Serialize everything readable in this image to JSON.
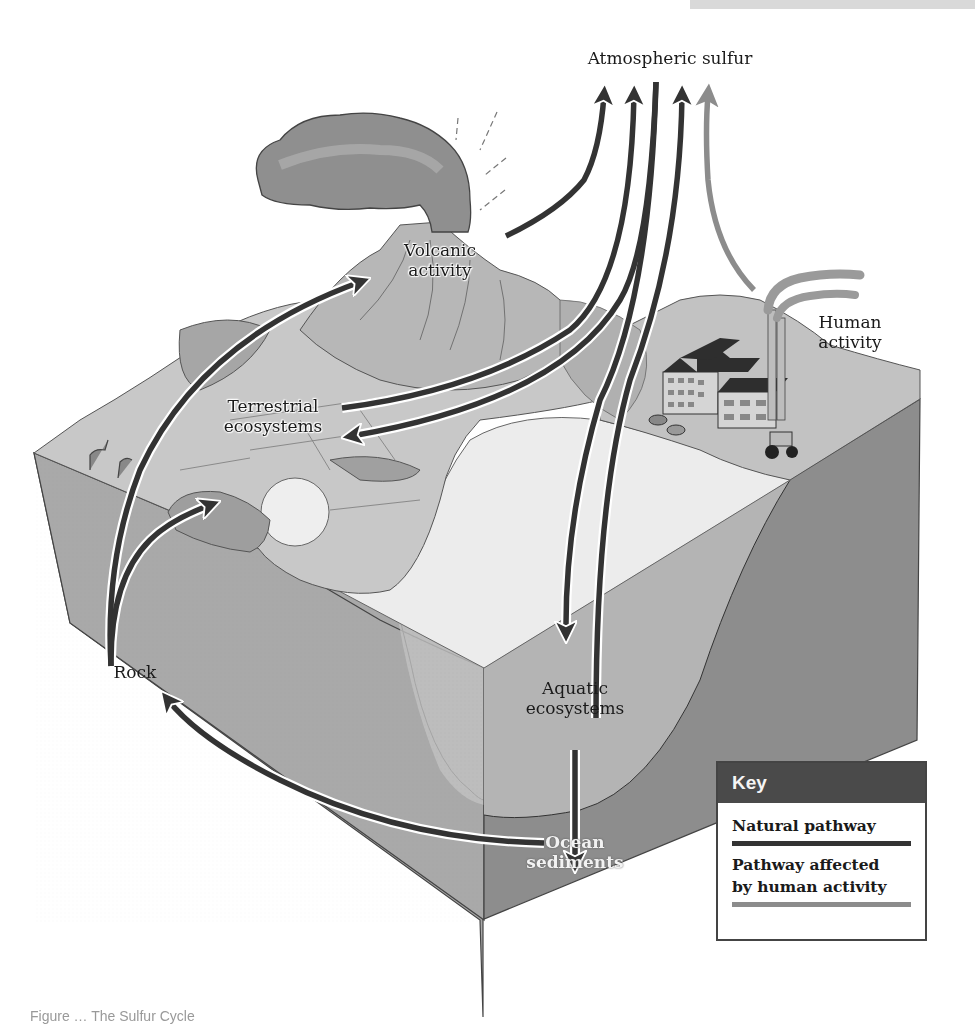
{
  "figure": {
    "title": "The Sulfur Cycle",
    "caption_partial": "Figure … The Sulfur Cycle"
  },
  "nodes": {
    "atmospheric_sulfur": "Atmospheric sulfur",
    "volcanic_activity_line1": "Volcanic",
    "volcanic_activity_line2": "activity",
    "human_activity_line1": "Human",
    "human_activity_line2": "activity",
    "terrestrial_line1": "Terrestrial",
    "terrestrial_line2": "ecosystems",
    "rock": "Rock",
    "aquatic_line1": "Aquatic",
    "aquatic_line2": "ecosystems",
    "ocean_line1": "Ocean",
    "ocean_line2": "sediments"
  },
  "key": {
    "title": "Key",
    "items": [
      {
        "label": "Natural pathway",
        "color": "#333333"
      },
      {
        "label_line1": "Pathway affected",
        "label_line2": "by human activity",
        "color": "#8c8c8c"
      }
    ]
  },
  "pathways": [
    {
      "from": "Volcanic activity",
      "to": "Atmospheric sulfur",
      "type": "natural"
    },
    {
      "from": "Terrestrial ecosystems",
      "to": "Atmospheric sulfur",
      "type": "natural"
    },
    {
      "from": "Atmospheric sulfur",
      "to": "Terrestrial ecosystems",
      "type": "natural"
    },
    {
      "from": "Atmospheric sulfur",
      "to": "Aquatic ecosystems",
      "type": "natural"
    },
    {
      "from": "Aquatic ecosystems",
      "to": "Atmospheric sulfur",
      "type": "natural"
    },
    {
      "from": "Human activity",
      "to": "Atmospheric sulfur",
      "type": "human"
    },
    {
      "from": "Rock",
      "to": "Volcanic activity",
      "type": "natural"
    },
    {
      "from": "Rock",
      "to": "Terrestrial ecosystems",
      "type": "natural"
    },
    {
      "from": "Aquatic ecosystems",
      "to": "Ocean sediments",
      "type": "natural"
    },
    {
      "from": "Ocean sediments",
      "to": "Rock",
      "type": "natural"
    }
  ],
  "colors": {
    "natural_arrow": "#333333",
    "human_arrow": "#8c8c8c",
    "key_header": "#4a4a4a",
    "block_side_left": "#a8a8a8",
    "block_side_right": "#8a8a8a",
    "water_top": "#e6e6e6",
    "land_top": "#c9c9c9"
  }
}
